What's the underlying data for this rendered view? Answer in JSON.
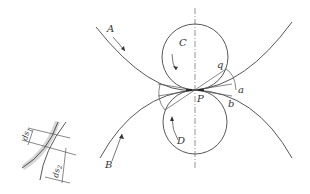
{
  "diagram": {
    "labels": {
      "A": "A",
      "B": "B",
      "C": "C",
      "D": "D",
      "P": "P",
      "q": "q",
      "a": "a",
      "b": "b"
    },
    "inset": {
      "ds1": "ds",
      "ds1_sub": "1",
      "ds2": "ds",
      "ds2_sub": "2"
    },
    "colors": {
      "stroke": "#444444",
      "shade": "#cccccc",
      "background": "#ffffff"
    }
  }
}
